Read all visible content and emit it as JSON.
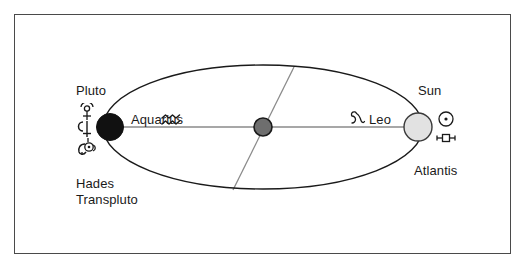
{
  "diagram": {
    "frame": {
      "border_color": "#4a4a4a"
    },
    "bodies": {
      "pluto": {
        "label": "Pluto",
        "color": "#111111",
        "glyph_name": "pluto-glyph",
        "cx": 110,
        "cy": 127,
        "r": 13
      },
      "center": {
        "label": "",
        "color": "#6e6e6e",
        "cx": 263,
        "cy": 127,
        "r": 9
      },
      "sun": {
        "label": "Sun",
        "color": "#e0e0e0",
        "glyph_name": "sun-glyph",
        "cx": 418,
        "cy": 127,
        "r": 14
      }
    },
    "orbit": {
      "cx": 263,
      "cy": 127,
      "rx": 160,
      "ry": 62,
      "stroke": "#1a1a1a",
      "major_axis_stroke": "#808080",
      "minor_axis_stroke": "#808080"
    },
    "labels": {
      "pluto": "Pluto",
      "hades": "Hades",
      "transpluto": "Transpluto",
      "aquarius": "Aquarius",
      "leo": "Leo",
      "sun": "Sun",
      "atlantis": "Atlantis"
    },
    "glyph_names": {
      "pluto": "pluto-glyph",
      "hades": "hades-glyph",
      "transpluto": "transpluto-glyph",
      "aquarius": "aquarius-glyph",
      "leo": "leo-glyph",
      "sun": "sun-glyph",
      "atlantis": "atlantis-glyph"
    },
    "glyph_chars": {
      "aquarius": "≈",
      "sun": "☉"
    }
  }
}
